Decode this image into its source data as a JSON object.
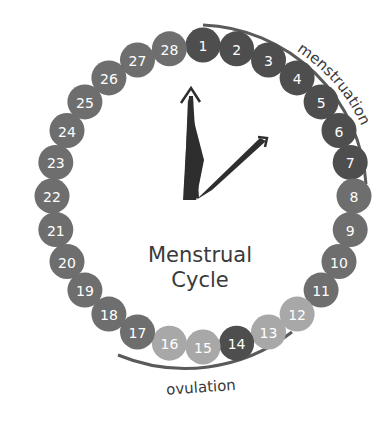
{
  "title": {
    "line1": "Menstrual",
    "line2": "Cycle"
  },
  "labels": {
    "menstruation": "menstruation",
    "ovulation": "ovulation"
  },
  "colors": {
    "dark": "#4e4e4e",
    "medium": "#6e6e6e",
    "light": "#a8a8a8",
    "hands": "#2e2e2e",
    "arc": "#5a5a5a"
  },
  "days": [
    {
      "n": "1",
      "shade": "dark"
    },
    {
      "n": "2",
      "shade": "dark"
    },
    {
      "n": "3",
      "shade": "dark"
    },
    {
      "n": "4",
      "shade": "dark"
    },
    {
      "n": "5",
      "shade": "dark"
    },
    {
      "n": "6",
      "shade": "dark"
    },
    {
      "n": "7",
      "shade": "dark"
    },
    {
      "n": "8",
      "shade": "medium"
    },
    {
      "n": "9",
      "shade": "medium"
    },
    {
      "n": "10",
      "shade": "medium"
    },
    {
      "n": "11",
      "shade": "medium"
    },
    {
      "n": "12",
      "shade": "light"
    },
    {
      "n": "13",
      "shade": "light"
    },
    {
      "n": "14",
      "shade": "dark"
    },
    {
      "n": "15",
      "shade": "light"
    },
    {
      "n": "16",
      "shade": "light"
    },
    {
      "n": "17",
      "shade": "medium"
    },
    {
      "n": "18",
      "shade": "medium"
    },
    {
      "n": "19",
      "shade": "medium"
    },
    {
      "n": "20",
      "shade": "medium"
    },
    {
      "n": "21",
      "shade": "medium"
    },
    {
      "n": "22",
      "shade": "medium"
    },
    {
      "n": "23",
      "shade": "medium"
    },
    {
      "n": "24",
      "shade": "medium"
    },
    {
      "n": "25",
      "shade": "medium"
    },
    {
      "n": "26",
      "shade": "medium"
    },
    {
      "n": "27",
      "shade": "medium"
    },
    {
      "n": "28",
      "shade": "medium"
    }
  ]
}
